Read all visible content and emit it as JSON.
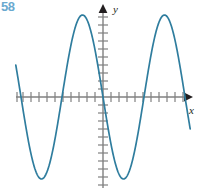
{
  "figure": {
    "exercise_number": "58",
    "exercise_number_color": "#6aa9cf",
    "background_color": "#ffffff",
    "axis_color": "#808080",
    "axis_arrow_color": "#231f20",
    "curve_color": "#2f7d9e",
    "x_axis_label": "x",
    "y_axis_label": "y"
  },
  "chart_data": {
    "type": "line",
    "title": "",
    "subtitle": "",
    "xlabel": "x",
    "ylabel": "y",
    "legend": [],
    "annotations": [],
    "grid": false,
    "tick_labels_shown": false,
    "axes": {
      "origin_px": [
        103,
        97
      ],
      "x_tick_spacing_px": 8,
      "y_tick_spacing_px": 8,
      "x_axis_start_px": 16,
      "x_axis_end_px": 190,
      "y_axis_top_px": 8,
      "y_axis_bottom_px": 188,
      "x_ticks_left_of_origin": 11,
      "x_ticks_right_of_origin": 11,
      "y_ticks_above_origin": 11,
      "y_ticks_below_origin": 11,
      "xlim": [
        -10.9,
        10.9
      ],
      "ylim": [
        -11.1,
        11.1
      ]
    },
    "function_description": "sinusoid",
    "amplitude": 10.25,
    "period_px": 82,
    "period_units": 10.25,
    "phase": "descending through origin",
    "key_points_px": {
      "left_trough": [
        42,
        183
      ],
      "left_zero_rising": [
        61,
        97
      ],
      "left_peak": [
        81,
        15
      ],
      "zero_descending": [
        103,
        97
      ],
      "right_trough": [
        123,
        183
      ],
      "right_zero_rising": [
        142,
        97
      ],
      "right_peak": [
        163,
        15
      ],
      "right_end": [
        184,
        97
      ]
    },
    "series": [
      {
        "name": "curve",
        "x": [
          -10.9,
          -10.0,
          -9.0,
          -8.0,
          -7.6,
          -7.0,
          -6.0,
          -5.2,
          -5.0,
          -4.0,
          -3.0,
          -2.7,
          -2.0,
          -1.0,
          0.0,
          1.0,
          2.0,
          2.5,
          3.0,
          4.0,
          5.0,
          5.1,
          6.0,
          7.0,
          7.6,
          8.0,
          9.0,
          10.0,
          10.2
        ],
        "y": [
          0.0,
          -6.0,
          -9.6,
          -10.2,
          -10.25,
          -8.7,
          -4.2,
          0.0,
          1.2,
          6.6,
          9.8,
          10.2,
          8.2,
          3.6,
          0.0,
          -3.6,
          -8.2,
          -9.8,
          -10.2,
          -7.2,
          -1.2,
          0.0,
          5.0,
          9.2,
          10.25,
          10.0,
          6.4,
          0.6,
          0.0
        ]
      }
    ]
  }
}
